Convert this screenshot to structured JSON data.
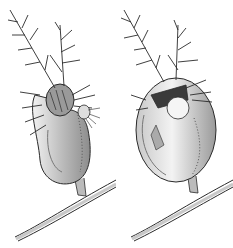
{
  "figure": {
    "panels": [
      {
        "id": "left",
        "subject": "bladder trap with door closed and small prey at entrance"
      },
      {
        "id": "right",
        "subject": "bladder trap swollen after capturing prey inside"
      }
    ],
    "colors": {
      "background": "#ffffff",
      "ink": "#2a2a2a",
      "shade": "#8a8a8a",
      "light_shade": "#d4d4d4"
    }
  }
}
